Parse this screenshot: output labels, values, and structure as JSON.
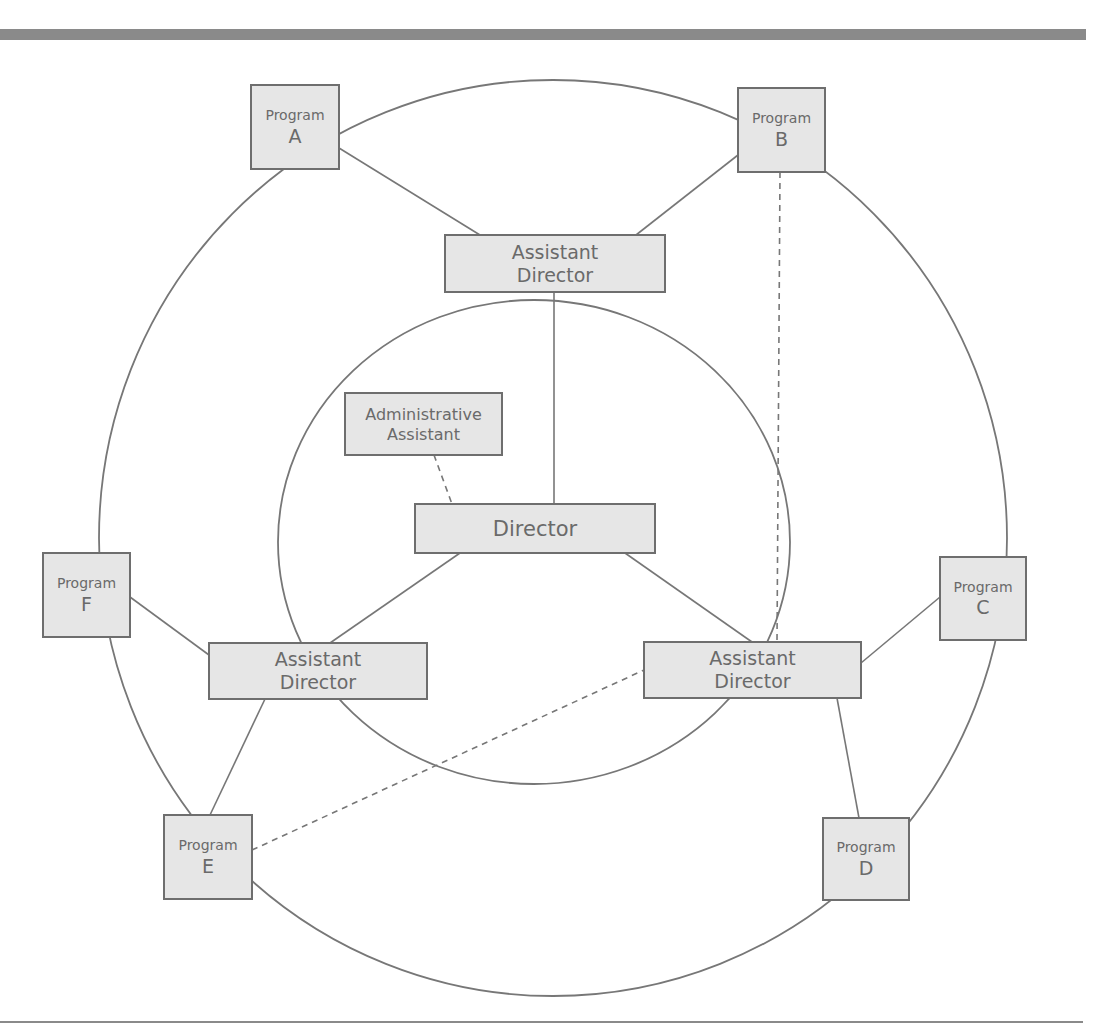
{
  "diagram": {
    "type": "organizational-structure",
    "rings": [
      {
        "id": "outer",
        "cx": 553,
        "cy": 538,
        "rx": 454,
        "ry": 458
      },
      {
        "id": "inner",
        "cx": 534,
        "cy": 542,
        "rx": 256,
        "ry": 242
      }
    ],
    "nodes": [
      {
        "id": "program_a",
        "lines": [
          "Program",
          "A"
        ],
        "x": 251,
        "y": 85,
        "w": 88,
        "h": 84,
        "size_small": 14,
        "size_big": 19
      },
      {
        "id": "program_b",
        "lines": [
          "Program",
          "B"
        ],
        "x": 738,
        "y": 88,
        "w": 87,
        "h": 84,
        "size_small": 14,
        "size_big": 19
      },
      {
        "id": "program_c",
        "lines": [
          "Program",
          "C"
        ],
        "x": 940,
        "y": 557,
        "w": 86,
        "h": 83,
        "size_small": 14,
        "size_big": 19
      },
      {
        "id": "program_d",
        "lines": [
          "Program",
          "D"
        ],
        "x": 823,
        "y": 818,
        "w": 86,
        "h": 82,
        "size_small": 14,
        "size_big": 19
      },
      {
        "id": "program_e",
        "lines": [
          "Program",
          "E"
        ],
        "x": 164,
        "y": 815,
        "w": 88,
        "h": 84,
        "size_small": 14,
        "size_big": 19
      },
      {
        "id": "program_f",
        "lines": [
          "Program",
          "F"
        ],
        "x": 43,
        "y": 553,
        "w": 87,
        "h": 84,
        "size_small": 14,
        "size_big": 19
      },
      {
        "id": "asst_dir_top",
        "lines": [
          "Assistant",
          "Director"
        ],
        "x": 445,
        "y": 235,
        "w": 220,
        "h": 57,
        "size_small": 19,
        "size_big": 19
      },
      {
        "id": "asst_dir_left",
        "lines": [
          "Assistant",
          "Director"
        ],
        "x": 209,
        "y": 643,
        "w": 218,
        "h": 56,
        "size_small": 19,
        "size_big": 19
      },
      {
        "id": "asst_dir_right",
        "lines": [
          "Assistant",
          "Director"
        ],
        "x": 644,
        "y": 642,
        "w": 217,
        "h": 56,
        "size_small": 19,
        "size_big": 19
      },
      {
        "id": "admin_assistant",
        "lines": [
          "Administrative",
          "Assistant"
        ],
        "x": 345,
        "y": 393,
        "w": 157,
        "h": 62,
        "size_small": 16,
        "size_big": 16
      },
      {
        "id": "director",
        "lines": [
          "Director"
        ],
        "x": 415,
        "y": 504,
        "w": 240,
        "h": 49,
        "size_small": 21,
        "size_big": 21
      }
    ],
    "edges": [
      {
        "from": "program_a",
        "to": "asst_dir_top",
        "x1": 339,
        "y1": 148,
        "x2": 480,
        "y2": 235,
        "style": "solid"
      },
      {
        "from": "program_b",
        "to": "asst_dir_top",
        "x1": 738,
        "y1": 155,
        "x2": 636,
        "y2": 235,
        "style": "solid"
      },
      {
        "from": "asst_dir_top",
        "to": "director",
        "x1": 554,
        "y1": 292,
        "x2": 554,
        "y2": 504,
        "style": "solid"
      },
      {
        "from": "admin_assistant",
        "to": "director",
        "x1": 434,
        "y1": 455,
        "x2": 452,
        "y2": 504,
        "style": "dashed"
      },
      {
        "from": "director",
        "to": "asst_dir_left",
        "x1": 460,
        "y1": 553,
        "x2": 330,
        "y2": 643,
        "style": "solid"
      },
      {
        "from": "director",
        "to": "asst_dir_right",
        "x1": 625,
        "y1": 553,
        "x2": 752,
        "y2": 642,
        "style": "solid"
      },
      {
        "from": "program_f",
        "to": "asst_dir_left",
        "x1": 130,
        "y1": 597,
        "x2": 209,
        "y2": 655,
        "style": "solid"
      },
      {
        "from": "asst_dir_left",
        "to": "program_e",
        "x1": 265,
        "y1": 699,
        "x2": 210,
        "y2": 815,
        "style": "solid"
      },
      {
        "from": "program_c",
        "to": "asst_dir_right",
        "x1": 940,
        "y1": 597,
        "x2": 861,
        "y2": 663,
        "style": "solid"
      },
      {
        "from": "asst_dir_right",
        "to": "program_d",
        "x1": 837,
        "y1": 698,
        "x2": 859,
        "y2": 818,
        "style": "solid"
      },
      {
        "from": "program_b",
        "to": "asst_dir_right",
        "x1": 780,
        "y1": 172,
        "x2": 777,
        "y2": 642,
        "style": "dashed"
      },
      {
        "from": "program_e",
        "to": "asst_dir_right",
        "x1": 252,
        "y1": 850,
        "x2": 644,
        "y2": 670,
        "style": "dashed"
      }
    ]
  }
}
